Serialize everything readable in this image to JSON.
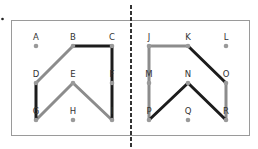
{
  "figure": {
    "bullet": "•",
    "colors": {
      "dark_path": "#1c1c1c",
      "light_path": "#8c8c8c",
      "dot": "#9a9a9a",
      "frame": "#9a9a9a",
      "divider": "#333333"
    },
    "left_panel": {
      "points": [
        {
          "label": "A",
          "x": 36,
          "y": 46
        },
        {
          "label": "B",
          "x": 73,
          "y": 46
        },
        {
          "label": "C",
          "x": 112,
          "y": 46
        },
        {
          "label": "D",
          "x": 36,
          "y": 83
        },
        {
          "label": "E",
          "x": 73,
          "y": 83
        },
        {
          "label": "F",
          "x": 112,
          "y": 83
        },
        {
          "label": "G",
          "x": 36,
          "y": 120
        },
        {
          "label": "H",
          "x": 73,
          "y": 120
        },
        {
          "label": "I",
          "x": 112,
          "y": 120
        }
      ],
      "dark_segments": [
        [
          "D",
          "G"
        ],
        [
          "B",
          "C"
        ],
        [
          "C",
          "I"
        ]
      ],
      "light_segments": [
        [
          "D",
          "B"
        ],
        [
          "G",
          "E"
        ],
        [
          "E",
          "I"
        ]
      ]
    },
    "right_panel": {
      "points": [
        {
          "label": "J",
          "x": 149,
          "y": 46
        },
        {
          "label": "K",
          "x": 188,
          "y": 46
        },
        {
          "label": "L",
          "x": 226,
          "y": 46
        },
        {
          "label": "M",
          "x": 149,
          "y": 83
        },
        {
          "label": "N",
          "x": 188,
          "y": 83
        },
        {
          "label": "O",
          "x": 226,
          "y": 83
        },
        {
          "label": "P",
          "x": 149,
          "y": 120
        },
        {
          "label": "Q",
          "x": 188,
          "y": 120
        },
        {
          "label": "R",
          "x": 226,
          "y": 120
        }
      ],
      "dark_segments": [
        [
          "K",
          "O"
        ],
        [
          "P",
          "N"
        ],
        [
          "N",
          "R"
        ]
      ],
      "light_segments": [
        [
          "J",
          "K"
        ],
        [
          "J",
          "P"
        ],
        [
          "O",
          "R"
        ]
      ]
    }
  }
}
